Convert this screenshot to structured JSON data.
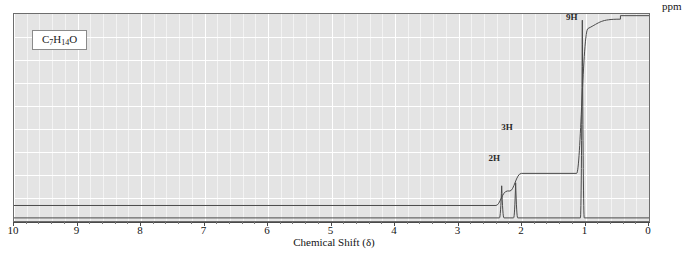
{
  "figure": {
    "formula_text": "C7H14O",
    "formula_parts": [
      {
        "t": "C",
        "sub": false
      },
      {
        "t": "7",
        "sub": true
      },
      {
        "t": "H",
        "sub": false
      },
      {
        "t": "14",
        "sub": true
      },
      {
        "t": "O",
        "sub": false
      }
    ],
    "xaxis_title": "Chemical Shift (δ)",
    "unit_label": "ppm",
    "background_color": "#e4e4e4",
    "grid_color": "#ffffff",
    "trace_color": "#4a4a4a",
    "frame_color": "#6d6d6d"
  },
  "chart_data": {
    "type": "line",
    "title": "",
    "subtitle": "",
    "xlabel": "Chemical Shift (δ)",
    "ylabel": "",
    "xlim": [
      10,
      0
    ],
    "ylim": [
      0,
      1
    ],
    "x_unit": "ppm",
    "grid": true,
    "legend": "none",
    "x_ticks": [
      10,
      9,
      8,
      7,
      6,
      5,
      4,
      3,
      2,
      1,
      0
    ],
    "x_tick_labels": [
      "10",
      "9",
      "8",
      "7",
      "6",
      "5",
      "4",
      "3",
      "2",
      "1",
      "0"
    ],
    "minor_ticks_per_major": 5,
    "peaks": [
      {
        "shift_ppm": 2.32,
        "integration": "2H",
        "relative_height": 0.155,
        "width_ppm": 0.035,
        "label": "2H"
      },
      {
        "shift_ppm": 2.1,
        "integration": "3H",
        "relative_height": 0.17,
        "width_ppm": 0.032,
        "label": "3H"
      },
      {
        "shift_ppm": 1.05,
        "integration": "9H",
        "relative_height": 0.955,
        "width_ppm": 0.03,
        "label": "9H"
      }
    ],
    "integration_steps": [
      {
        "shift_ppm": 2.32,
        "rise": 0.055,
        "cumulative_after": 0.145
      },
      {
        "shift_ppm": 2.1,
        "rise": 0.085,
        "cumulative_after": 0.23
      },
      {
        "shift_ppm": 1.05,
        "rise": 0.7,
        "cumulative_after": 0.93
      }
    ],
    "baseline_level": 0.015,
    "integration_curve_start": 0.075,
    "annotations": [
      {
        "text": "2H",
        "x_ppm": 2.4,
        "y_rel": 0.275
      },
      {
        "text": "3H",
        "x_ppm": 2.2,
        "y_rel": 0.425
      },
      {
        "text": "9H",
        "x_ppm": 1.18,
        "y_rel": 0.955
      }
    ]
  }
}
